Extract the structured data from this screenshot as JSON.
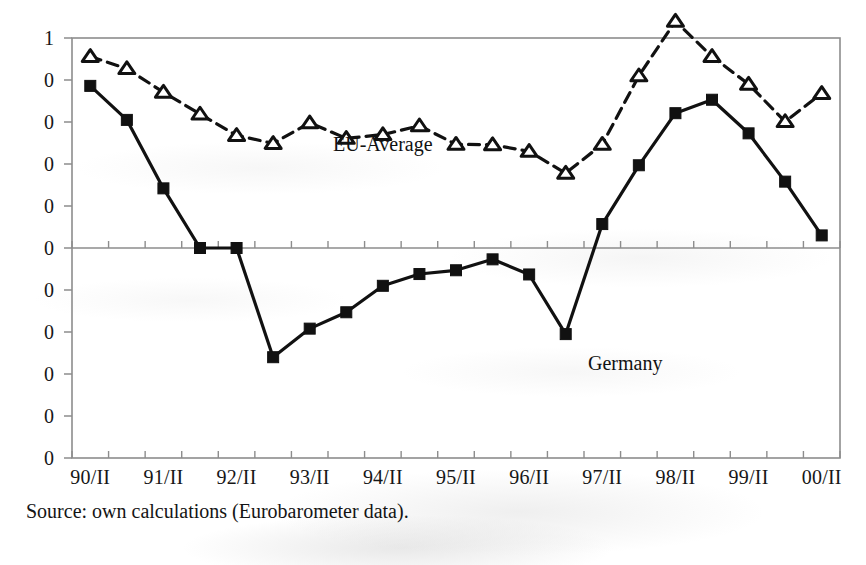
{
  "figure": {
    "source_caption": "Source: own calculations (Eurobarometer data).",
    "annotations": [
      {
        "name": "eu-average",
        "text": "EU-Average",
        "x": 333,
        "y": 133
      },
      {
        "name": "germany",
        "text": "Germany",
        "x": 588,
        "y": 352
      }
    ]
  },
  "chart_data": {
    "type": "line",
    "title": "",
    "xlabel": "",
    "ylabel": "",
    "grid": false,
    "legend_position": "inline-annotation",
    "note": "Y-axis tick labels are cropped at the left edge of the scanned image; only the final character of each label is rendered.",
    "y_tick_labels": [
      "1",
      "0",
      "0",
      "0",
      "0",
      "0",
      "0",
      "0",
      "0",
      "0",
      "0"
    ],
    "x_tick_labels": [
      "90/II",
      "91/II",
      "92/II",
      "93/II",
      "94/II",
      "95/II",
      "96/II",
      "97/II",
      "98/II",
      "99/II",
      "00/II"
    ],
    "x": [
      "90/II",
      "91/I",
      "91/II",
      "92/I",
      "92/II",
      "93/I",
      "93/II",
      "94/I",
      "94/II",
      "95/I",
      "95/II",
      "96/I",
      "96/II",
      "97/I",
      "97/II",
      "98/I",
      "98/II",
      "99/I",
      "99/II",
      "00/I",
      "00/II"
    ],
    "axis_ranges": {
      "y_index_top": 0,
      "y_index_bottom": 10,
      "y_index_zero": 5
    },
    "series": [
      {
        "name": "EU-Average",
        "marker": "open-triangle",
        "line_style": "dashed",
        "color": "#111111",
        "values": [
          4.56,
          4.27,
          3.71,
          3.19,
          2.68,
          2.49,
          2.98,
          2.61,
          2.7,
          2.91,
          2.47,
          2.46,
          2.3,
          1.78,
          2.47,
          4.1,
          5.4,
          4.56,
          3.9,
          3.01,
          3.68
        ]
      },
      {
        "name": "Germany",
        "marker": "filled-square",
        "line_style": "solid",
        "color": "#111111",
        "values": [
          3.86,
          3.05,
          1.42,
          0.0,
          0.0,
          -2.6,
          -1.92,
          -1.53,
          -0.9,
          -0.62,
          -0.53,
          -0.27,
          -0.63,
          -2.05,
          0.57,
          1.97,
          3.21,
          3.53,
          2.73,
          1.58,
          0.3
        ]
      }
    ]
  }
}
